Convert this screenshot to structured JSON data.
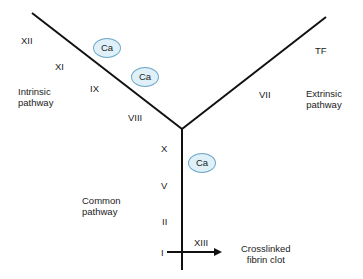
{
  "diagram": {
    "line_color": "#111111",
    "calcium_fill": "#dff0f8",
    "calcium_stroke": "#6fa8c8",
    "intrinsic": {
      "label_line1": "Intrinsic",
      "label_line2": "pathway",
      "factors": [
        "XII",
        "XI",
        "IX",
        "VIII"
      ]
    },
    "extrinsic": {
      "label_line1": "Extrinsic",
      "label_line2": "pathway",
      "factors": [
        "TF",
        "VII"
      ]
    },
    "common": {
      "label_line1": "Common",
      "label_line2": "pathway",
      "factors": [
        "X",
        "V",
        "II",
        "I"
      ]
    },
    "calcium": [
      "Ca",
      "Ca",
      "Ca"
    ],
    "crosslink_factor": "XIII",
    "product": {
      "line1": "Crosslinked",
      "line2": "fibrin clot"
    }
  }
}
